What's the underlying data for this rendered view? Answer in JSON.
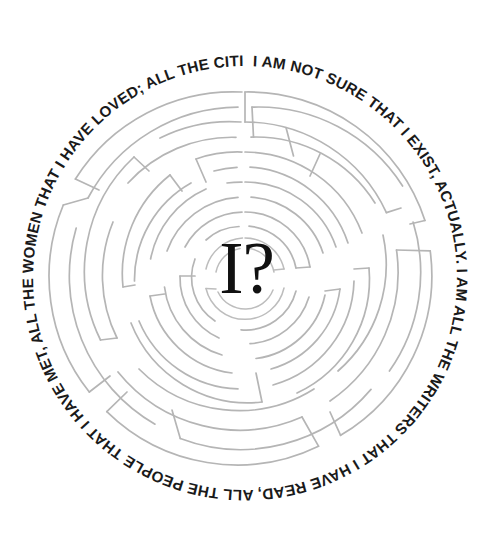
{
  "artwork": {
    "title": "Circular Labyrinth With Quotation",
    "center_glyph": "I?",
    "rim_text": "I AM NOT SURE THAT I EXIST, ACTUALLY. I AM ALL THE WRITERS THAT I HAVE READ, ALL THE PEOPLE THAT I HAVE MET, ALL THE WOMEN THAT I HAVE LOVED; ALL THE CITIES I HAVE VISITED.",
    "rim_text_segments": [
      "I AM NOT SURE THAT I EXIST, ACTUALLY.",
      "I AM ALL THE WRITERS THAT I HAVE READ,",
      "ALL THE PEOPLE THAT I HAVE MET,",
      "ALL THE WOMEN THAT I HAVE LOVED;",
      "ALL THE CITIES I HAVE VISITED."
    ],
    "colors": {
      "background": "#ffffff",
      "maze_line": "#b5b5b5",
      "text": "#1a1a1a",
      "center_glyph": "#111111"
    },
    "geometry": {
      "canvas_width": 491,
      "canvas_height": 545,
      "center_x": 245,
      "center_y": 278,
      "outer_ring_radius": 186,
      "text_path_radius": 212,
      "ring_count": 12,
      "ring_spacing": 15
    }
  }
}
